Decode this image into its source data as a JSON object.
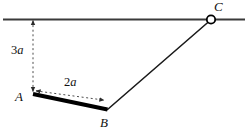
{
  "figure": {
    "canvas": {
      "width": 249,
      "height": 133,
      "background": "#ffffff"
    },
    "colors": {
      "ceiling": "#3a3a3a",
      "rod_thick": "#000000",
      "rod_thin": "#1a1a1a",
      "dashed": "#4d4d4d",
      "label": "#111111",
      "pivot_fill": "#ffffff",
      "pivot_stroke": "#000000"
    },
    "ceiling": {
      "name": "horizontal support line",
      "x1": 3,
      "y1": 19.5,
      "x2": 245,
      "y2": 19.5,
      "stroke_width": 2.2
    },
    "points": [
      {
        "id": "A",
        "label": "A",
        "x": 33,
        "y": 94,
        "label_x": 16,
        "label_y": 91
      },
      {
        "id": "B",
        "label": "B",
        "x": 107,
        "y": 109,
        "label_x": 100,
        "label_y": 117
      },
      {
        "id": "C",
        "label": "C",
        "x": 211,
        "y": 19.5,
        "label_x": 214,
        "label_y": 1
      }
    ],
    "pivot": {
      "name": "hinge at C",
      "cx": 211,
      "cy": 19.5,
      "r": 4.2,
      "stroke_width": 1.8
    },
    "segments": [
      {
        "id": "AB",
        "name": "thick rod AB",
        "x1": 33,
        "y1": 94,
        "x2": 107.5,
        "y2": 109.5,
        "stroke_width": 4.2,
        "style": "solid"
      },
      {
        "id": "BC",
        "name": "thin rod BC",
        "x1": 107.5,
        "y1": 109.5,
        "x2": 210,
        "y2": 20.5,
        "stroke_width": 1.6,
        "style": "solid"
      }
    ],
    "dimensions": [
      {
        "id": "dim-3a",
        "label": "3a",
        "number": "3",
        "symbol": "a",
        "orientation": "vertical",
        "x1": 33,
        "y1": 19.5,
        "x2": 33,
        "y2": 92.5,
        "label_x": 11,
        "label_y": 44,
        "stroke_width": 1,
        "dash": "2,2.6",
        "arrows": "both"
      },
      {
        "id": "dim-2a",
        "label": "2a",
        "number": "2",
        "symbol": "a",
        "orientation": "along-rod",
        "x1": 35,
        "y1": 90.5,
        "x2": 106,
        "y2": 100.5,
        "label_x": 64,
        "label_y": 76,
        "stroke_width": 1,
        "dash": "2,2.6",
        "arrows": "both"
      }
    ]
  }
}
